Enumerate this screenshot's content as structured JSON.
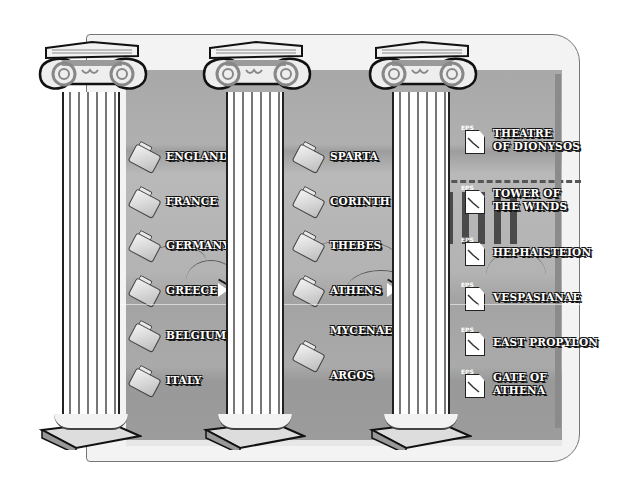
{
  "colors": {
    "panel": "#aaaaaa",
    "frame": "#f3f3f3",
    "outline": "#222222",
    "label_text": "#ffffff"
  },
  "columns": [
    {
      "name": "countries",
      "items": [
        {
          "label": "ENGLAND",
          "icon": "folder-icon"
        },
        {
          "label": "FRANCE",
          "icon": "folder-icon"
        },
        {
          "label": "GERMANY",
          "icon": "folder-icon"
        },
        {
          "label": "GREECE",
          "icon": "folder-icon",
          "selected": true
        },
        {
          "label": "BELGIUM",
          "icon": "folder-icon"
        },
        {
          "label": "ITALY",
          "icon": "folder-icon"
        }
      ]
    },
    {
      "name": "cities",
      "items": [
        {
          "label": "SPARTA",
          "icon": "folder-icon"
        },
        {
          "label": "CORINTH",
          "icon": "folder-icon"
        },
        {
          "label": "THEBES",
          "icon": "folder-icon"
        },
        {
          "label": "ATHENS",
          "icon": "folder-icon",
          "selected": true
        },
        {
          "label": "MYCENAE",
          "icon": "none"
        },
        {
          "label": "ARGOS",
          "icon": "folder-icon"
        }
      ]
    },
    {
      "name": "files",
      "items": [
        {
          "label_line1": "THEATRE",
          "label_line2": "OF DIONYSOS",
          "icon": "eps-file-icon",
          "tag": "EPS"
        },
        {
          "label_line1": "TOWER OF",
          "label_line2": "THE WINDS",
          "icon": "eps-file-icon",
          "tag": "EPS"
        },
        {
          "label_line1": "HEPHAISTEION",
          "label_line2": "",
          "icon": "eps-file-icon",
          "tag": "EPS"
        },
        {
          "label_line1": "VESPASIANAE",
          "label_line2": "",
          "icon": "eps-file-icon",
          "tag": "EPS"
        },
        {
          "label_line1": "EAST PROPYLON",
          "label_line2": "",
          "icon": "eps-file-icon",
          "tag": "EPS"
        },
        {
          "label_line1": "GATE OF",
          "label_line2": "ATHENA",
          "icon": "eps-file-icon",
          "tag": "EPS"
        }
      ]
    }
  ]
}
